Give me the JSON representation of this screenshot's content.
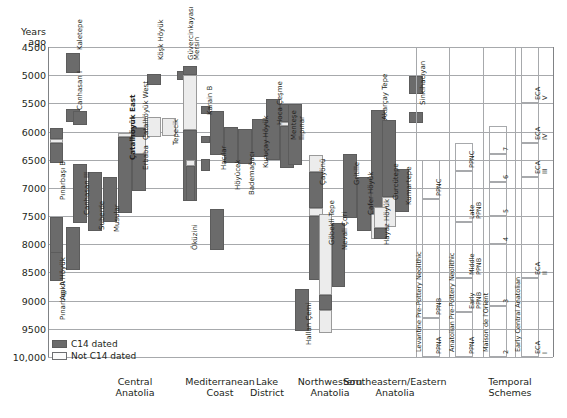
{
  "axis": {
    "y_title_line1": "Years",
    "y_title_line2": "ago",
    "y_ticks": [
      "4500",
      "5000",
      "5500",
      "6000",
      "6500",
      "7000",
      "7500",
      "8000",
      "8500",
      "9000",
      "9500",
      "10,000"
    ],
    "y_min": 4500,
    "y_max": 10000
  },
  "legend": {
    "items": [
      {
        "label": "C14 dated",
        "swatch": "c14",
        "color": "#6b6b6b"
      },
      {
        "label": "Not C14 dated",
        "swatch": "noc14",
        "color": "#fbfbfb"
      }
    ]
  },
  "regions": [
    {
      "line1": "Central",
      "line2": "Anatolia"
    },
    {
      "line1": "Mediterranean",
      "line2": "Coast"
    },
    {
      "line1": "Lake",
      "line2": "District"
    },
    {
      "line1": "Northwestern",
      "line2": "Anatolia"
    },
    {
      "line1": "Southeastern/Eastern",
      "line2": "Anatolia"
    },
    {
      "line1": "Temporal",
      "line2": "Schemes"
    }
  ],
  "chart_data": {
    "type": "bar",
    "orientation": "vertical-range",
    "xlabel": "",
    "ylabel": "Years ago",
    "ylim": [
      4500,
      10000
    ],
    "grid": true,
    "legend_position": "bottom-left",
    "series": [
      {
        "name": "C14 dated",
        "color": "#6b6b6b"
      },
      {
        "name": "Not C14 dated",
        "color": "#ececec"
      }
    ],
    "sites": [
      {
        "label": "Pınarbaşı B",
        "region": "Central Anatolia",
        "bold": false,
        "segments": [
          {
            "from": 5930,
            "to": 6130,
            "dated": "C14 dated"
          },
          {
            "from": 6130,
            "to": 6210,
            "dated": "Not C14 dated"
          },
          {
            "from": 6210,
            "to": 6560,
            "dated": "C14 dated"
          }
        ]
      },
      {
        "label": "Aşıklı Höyük",
        "region": "Central Anatolia",
        "bold": false,
        "segments": [
          {
            "from": 7520,
            "to": 8500,
            "dated": "C14 dated"
          }
        ]
      },
      {
        "label": "Pınarbaşı A",
        "region": "Central Anatolia",
        "bold": false,
        "segments": [
          {
            "from": 8130,
            "to": 8650,
            "dated": "C14 dated"
          }
        ]
      },
      {
        "label": "Kaletepe",
        "region": "Central Anatolia",
        "bold": false,
        "segments": [
          {
            "from": 4600,
            "to": 4960,
            "dated": "C14 dated"
          }
        ]
      },
      {
        "label": "Kaletepe (lower)",
        "region": "Central Anatolia",
        "bold": false,
        "segments": [
          {
            "from": 7700,
            "to": 8450,
            "dated": "C14 dated"
          }
        ]
      },
      {
        "label": "Canhasan I",
        "region": "Central Anatolia",
        "bold": false,
        "segments": [
          {
            "from": 5600,
            "to": 5830,
            "dated": "C14 dated"
          }
        ]
      },
      {
        "label": "Canhasan III",
        "region": "Central Anatolia",
        "bold": false,
        "segments": [
          {
            "from": 5640,
            "to": 5890,
            "dated": "C14 dated"
          }
        ]
      },
      {
        "label": "Canhasan III (lower)",
        "region": "Central Anatolia",
        "bold": false,
        "segments": [
          {
            "from": 6570,
            "to": 7620,
            "dated": "C14 dated"
          }
        ]
      },
      {
        "label": "Suberde",
        "region": "Central Anatolia",
        "bold": false,
        "segments": [
          {
            "from": 6720,
            "to": 7760,
            "dated": "C14 dated"
          }
        ]
      },
      {
        "label": "Musular",
        "region": "Central Anatolia",
        "bold": false,
        "segments": [
          {
            "from": 6800,
            "to": 7600,
            "dated": "C14 dated"
          }
        ]
      },
      {
        "label": "Çatalhöyük East",
        "region": "Central Anatolia",
        "bold": true,
        "segments": [
          {
            "from": 6030,
            "to": 6100,
            "dated": "Not C14 dated"
          },
          {
            "from": 6100,
            "to": 7440,
            "dated": "C14 dated"
          }
        ]
      },
      {
        "label": "Erbaba",
        "region": "Central Anatolia",
        "bold": false,
        "segments": [
          {
            "from": 5980,
            "to": 6390,
            "dated": "Not C14 dated"
          },
          {
            "from": 6390,
            "to": 7050,
            "dated": "C14 dated"
          }
        ]
      },
      {
        "label": "Çatalhöyük West",
        "region": "Mediterranean Coast",
        "bold": false,
        "segments": [
          {
            "from": 5740,
            "to": 5930,
            "dated": "Not C14 dated"
          },
          {
            "from": 5930,
            "to": 6100,
            "dated": "C14 dated"
          }
        ]
      },
      {
        "label": "Köşk Höyük",
        "region": "Mediterranean Coast",
        "bold": false,
        "segments": [
          {
            "from": 4980,
            "to": 5180,
            "dated": "C14 dated"
          }
        ]
      },
      {
        "label": "Köşk Höyük (lower)",
        "region": "Mediterranean Coast",
        "bold": false,
        "segments": [
          {
            "from": 5740,
            "to": 6090,
            "dated": "Not C14 dated"
          }
        ]
      },
      {
        "label": "Tepecik",
        "region": "Mediterranean Coast",
        "bold": false,
        "segments": [
          {
            "from": 5760,
            "to": 6080,
            "dated": "Not C14 dated"
          }
        ]
      },
      {
        "label": "Güvercinkayası",
        "region": "Mediterranean Coast",
        "bold": false,
        "segments": [
          {
            "from": 4930,
            "to": 5090,
            "dated": "C14 dated"
          }
        ]
      },
      {
        "label": "Mersin",
        "region": "Mediterranean Coast",
        "bold": false,
        "segments": [
          {
            "from": 4830,
            "to": 4990,
            "dated": "C14 dated"
          },
          {
            "from": 4990,
            "to": 5970,
            "dated": "Not C14 dated"
          },
          {
            "from": 5970,
            "to": 7230,
            "dated": "C14 dated"
          }
        ]
      },
      {
        "label": "Öküzini",
        "region": "Mediterranean Coast",
        "bold": false,
        "segments": [
          {
            "from": 6500,
            "to": 6620,
            "dated": "Not C14 dated"
          },
          {
            "from": 6620,
            "to": 7240,
            "dated": "C14 dated"
          }
        ]
      },
      {
        "label": "Karain B",
        "region": "Lake District",
        "bold": false,
        "segments": [
          {
            "from": 5540,
            "to": 5690,
            "dated": "C14 dated"
          }
        ]
      },
      {
        "label": "Karain B (lower)",
        "region": "Lake District",
        "bold": false,
        "segments": [
          {
            "from": 6080,
            "to": 6200,
            "dated": "C14 dated"
          }
        ]
      },
      {
        "label": "Karain B (lowest)",
        "region": "Lake District",
        "bold": false,
        "segments": [
          {
            "from": 6490,
            "to": 6700,
            "dated": "C14 dated"
          }
        ]
      },
      {
        "label": "Hacılar",
        "region": "Lake District",
        "bold": false,
        "segments": [
          {
            "from": 5640,
            "to": 6420,
            "dated": "C14 dated"
          }
        ]
      },
      {
        "label": "Hacılar (lower)",
        "region": "Lake District",
        "bold": false,
        "segments": [
          {
            "from": 7370,
            "to": 8110,
            "dated": "C14 dated"
          }
        ]
      },
      {
        "label": "Höyücek",
        "region": "Lake District",
        "bold": false,
        "segments": [
          {
            "from": 5920,
            "to": 6560,
            "dated": "C14 dated"
          }
        ]
      },
      {
        "label": "Bademağacı",
        "region": "Lake District",
        "bold": false,
        "segments": [
          {
            "from": 5950,
            "to": 6580,
            "dated": "C14 dated"
          }
        ]
      },
      {
        "label": "Kuruçay Höyük",
        "region": "Northwestern Anatolia",
        "bold": false,
        "segments": [
          {
            "from": 5780,
            "to": 6460,
            "dated": "C14 dated"
          }
        ]
      },
      {
        "label": "Hoca Çeşme",
        "region": "Northwestern Anatolia",
        "bold": false,
        "segments": [
          {
            "from": 5420,
            "to": 6500,
            "dated": "C14 dated"
          }
        ]
      },
      {
        "label": "Menteşe",
        "region": "Northwestern Anatolia",
        "bold": false,
        "segments": [
          {
            "from": 5520,
            "to": 5830,
            "dated": "C14 dated"
          },
          {
            "from": 5830,
            "to": 5910,
            "dated": "Not C14 dated"
          },
          {
            "from": 5910,
            "to": 6640,
            "dated": "C14 dated"
          }
        ]
      },
      {
        "label": "Ilıpınar",
        "region": "Northwestern Anatolia",
        "bold": false,
        "segments": [
          {
            "from": 5520,
            "to": 6600,
            "dated": "C14 dated"
          }
        ]
      },
      {
        "label": "Hallan Çemi",
        "region": "Southeastern/Eastern Anatolia",
        "bold": false,
        "segments": [
          {
            "from": 8800,
            "to": 9540,
            "dated": "C14 dated"
          }
        ]
      },
      {
        "label": "Çayönü",
        "region": "Southeastern/Eastern Anatolia",
        "bold": false,
        "segments": [
          {
            "from": 6420,
            "to": 6720,
            "dated": "Not C14 dated"
          },
          {
            "from": 6720,
            "to": 7360,
            "dated": "C14 dated"
          },
          {
            "from": 7360,
            "to": 7500,
            "dated": "Not C14 dated"
          },
          {
            "from": 7500,
            "to": 8640,
            "dated": "C14 dated"
          }
        ]
      },
      {
        "label": "Göbekli Tepe",
        "region": "Southeastern/Eastern Anatolia",
        "bold": false,
        "segments": [
          {
            "from": 7470,
            "to": 8900,
            "dated": "Not C14 dated"
          },
          {
            "from": 8900,
            "to": 9160,
            "dated": "C14 dated"
          },
          {
            "from": 9160,
            "to": 9580,
            "dated": "Not C14 dated"
          }
        ]
      },
      {
        "label": "Nevali Çori",
        "region": "Southeastern/Eastern Anatolia",
        "bold": false,
        "segments": [
          {
            "from": 7620,
            "to": 8750,
            "dated": "C14 dated"
          }
        ]
      },
      {
        "label": "Gritille",
        "region": "Southeastern/Eastern Anatolia",
        "bold": false,
        "segments": [
          {
            "from": 6400,
            "to": 7530,
            "dated": "C14 dated"
          }
        ]
      },
      {
        "label": "Cafer Höyük",
        "region": "Southeastern/Eastern Anatolia",
        "bold": false,
        "segments": [
          {
            "from": 6800,
            "to": 7760,
            "dated": "C14 dated"
          }
        ]
      },
      {
        "label": "Akarçay Tepe",
        "region": "Southeastern/Eastern Anatolia",
        "bold": false,
        "segments": [
          {
            "from": 5620,
            "to": 7470,
            "dated": "C14 dated"
          },
          {
            "from": 7470,
            "to": 7900,
            "dated": "Not C14 dated"
          }
        ]
      },
      {
        "label": "Gurcütepe",
        "region": "Southeastern/Eastern Anatolia",
        "bold": false,
        "segments": [
          {
            "from": 5790,
            "to": 7160,
            "dated": "C14 dated"
          },
          {
            "from": 7160,
            "to": 7700,
            "dated": "Not C14 dated"
          }
        ]
      },
      {
        "label": "Hayaz Höyük",
        "region": "Southeastern/Eastern Anatolia",
        "bold": false,
        "segments": [
          {
            "from": 7330,
            "to": 7720,
            "dated": "Not C14 dated"
          },
          {
            "from": 7720,
            "to": 7900,
            "dated": "C14 dated"
          }
        ]
      },
      {
        "label": "Kumartepe",
        "region": "Southeastern/Eastern Anatolia",
        "bold": false,
        "segments": [
          {
            "from": 6660,
            "to": 7420,
            "dated": "C14 dated"
          }
        ]
      },
      {
        "label": "Sinkihacıyan",
        "region": "Southeastern/Eastern Anatolia",
        "bold": false,
        "segments": [
          {
            "from": 5020,
            "to": 5330,
            "dated": "C14 dated"
          }
        ]
      },
      {
        "label": "Sinkihacıyan (lower)",
        "region": "Southeastern/Eastern Anatolia",
        "bold": false,
        "segments": [
          {
            "from": 5660,
            "to": 5850,
            "dated": "C14 dated"
          }
        ]
      }
    ],
    "temporal_schemes": [
      {
        "group": "Levantine Pre-Pottery Neolithic",
        "phases": [
          {
            "label": "PPNC",
            "from": 6500,
            "to": 7200
          },
          {
            "label": "PPNB",
            "from": 7200,
            "to": 9300
          },
          {
            "label": "PPNA",
            "from": 9300,
            "to": 10000
          }
        ]
      },
      {
        "group": "Anatolian Pre-Pottery Neolithic",
        "phases": [
          {
            "label": "PPNC",
            "from": 6200,
            "to": 6700
          },
          {
            "label": "Late PPNB",
            "from": 6700,
            "to": 7600
          },
          {
            "label": "Middle PPNB",
            "from": 7600,
            "to": 8600
          },
          {
            "label": "Early PPNB",
            "from": 8600,
            "to": 9200
          },
          {
            "label": "PPNA",
            "from": 9200,
            "to": 10000
          }
        ]
      },
      {
        "group": "Maison de l'Orient",
        "phases": [
          {
            "label": "7",
            "from": 5900,
            "to": 6400
          },
          {
            "label": "6",
            "from": 6400,
            "to": 6900
          },
          {
            "label": "5",
            "from": 6900,
            "to": 7500
          },
          {
            "label": "4",
            "from": 7500,
            "to": 8000
          },
          {
            "label": "3",
            "from": 8000,
            "to": 9100
          },
          {
            "label": "2",
            "from": 9100,
            "to": 10000
          }
        ]
      },
      {
        "group": "Early Central Anatolian",
        "phases": [
          {
            "label": "ECA V",
            "from": 4500,
            "to": 5500
          },
          {
            "label": "ECA IV",
            "from": 5500,
            "to": 6200
          },
          {
            "label": "ECA III",
            "from": 6200,
            "to": 6800
          },
          {
            "label": "ECA II",
            "from": 6800,
            "to": 8600
          },
          {
            "label": "ECA I",
            "from": 8600,
            "to": 10000
          }
        ]
      }
    ]
  }
}
